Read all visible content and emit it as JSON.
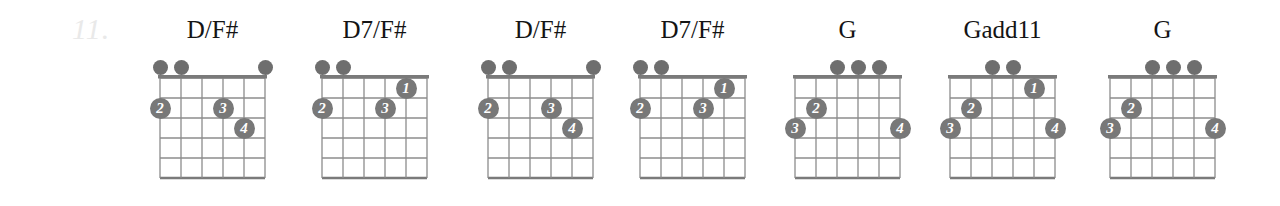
{
  "exercise": {
    "number": "11."
  },
  "layout": {
    "string_spacing": 21,
    "fret_spacing": 20,
    "strings": 6,
    "frets": 5,
    "open_dot_diameter": 15,
    "finger_diameter": 21
  },
  "colors": {
    "grid": "#8c8c8c",
    "nut": "#7a7a7a",
    "dot": "#6e6e6e",
    "finger_fill": "#787878",
    "finger_text": "#ffffff",
    "title": "#141414",
    "exercise_number": "#e9e9e9",
    "background": "#ffffff"
  },
  "chords": [
    {
      "name": "D/F#",
      "left": 140,
      "grid_left": 20,
      "open_strings": [
        6,
        5,
        1
      ],
      "fingers": [
        {
          "label": "2",
          "string": 6,
          "fret": 2
        },
        {
          "label": "3",
          "string": 3,
          "fret": 2
        },
        {
          "label": "4",
          "string": 2,
          "fret": 3
        }
      ]
    },
    {
      "name": "D7/F#",
      "left": 302,
      "grid_left": 20,
      "open_strings": [
        6,
        5
      ],
      "fingers": [
        {
          "label": "1",
          "string": 2,
          "fret": 1
        },
        {
          "label": "2",
          "string": 6,
          "fret": 2
        },
        {
          "label": "3",
          "string": 3,
          "fret": 2
        }
      ]
    },
    {
      "name": "D/F#",
      "left": 468,
      "grid_left": 20,
      "open_strings": [
        6,
        5,
        1
      ],
      "fingers": [
        {
          "label": "2",
          "string": 6,
          "fret": 2
        },
        {
          "label": "3",
          "string": 3,
          "fret": 2
        },
        {
          "label": "4",
          "string": 2,
          "fret": 3
        }
      ]
    },
    {
      "name": "D7/F#",
      "left": 620,
      "grid_left": 20,
      "open_strings": [
        6,
        5
      ],
      "fingers": [
        {
          "label": "1",
          "string": 2,
          "fret": 1
        },
        {
          "label": "2",
          "string": 6,
          "fret": 2
        },
        {
          "label": "3",
          "string": 3,
          "fret": 2
        }
      ]
    },
    {
      "name": "G",
      "left": 775,
      "grid_left": 20,
      "open_strings": [
        4,
        3,
        2
      ],
      "fingers": [
        {
          "label": "2",
          "string": 5,
          "fret": 2
        },
        {
          "label": "3",
          "string": 6,
          "fret": 3
        },
        {
          "label": "4",
          "string": 1,
          "fret": 3
        }
      ]
    },
    {
      "name": "Gadd11",
      "left": 930,
      "grid_left": 20,
      "open_strings": [
        4,
        3
      ],
      "fingers": [
        {
          "label": "1",
          "string": 2,
          "fret": 1
        },
        {
          "label": "2",
          "string": 5,
          "fret": 2
        },
        {
          "label": "3",
          "string": 6,
          "fret": 3
        },
        {
          "label": "4",
          "string": 1,
          "fret": 3
        }
      ]
    },
    {
      "name": "G",
      "left": 1090,
      "grid_left": 20,
      "open_strings": [
        4,
        3,
        2
      ],
      "fingers": [
        {
          "label": "2",
          "string": 5,
          "fret": 2
        },
        {
          "label": "3",
          "string": 6,
          "fret": 3
        },
        {
          "label": "4",
          "string": 1,
          "fret": 3
        }
      ]
    }
  ]
}
